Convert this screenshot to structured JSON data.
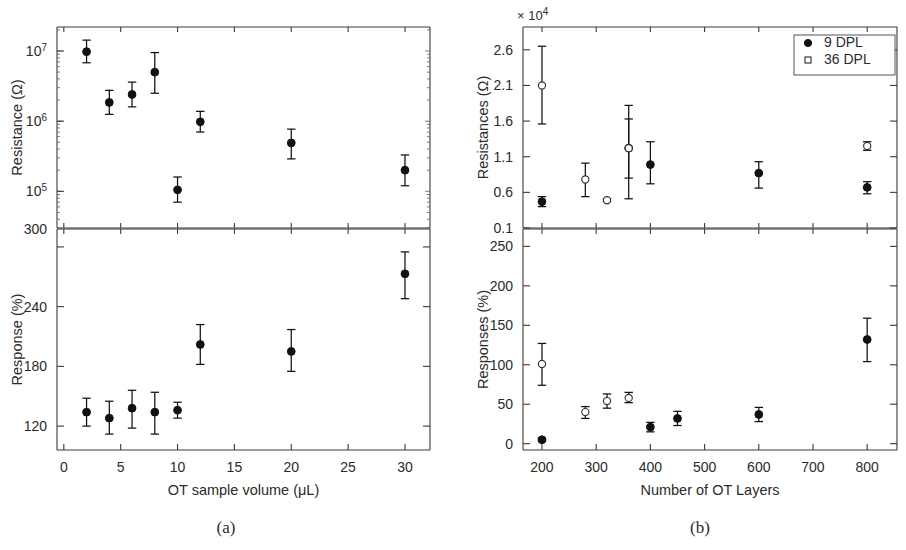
{
  "figure": {
    "panels": [
      {
        "id": "a",
        "caption": "(a)",
        "x_axis": {
          "label": "OT sample volume (μL)",
          "ticks": [
            0,
            5,
            10,
            15,
            20,
            25,
            30
          ],
          "min": -0.6,
          "max": 32.2
        },
        "top": {
          "ylabel": "Resistance (Ω)",
          "scale": "log",
          "ticks": [
            "10",
            "10",
            "10",
            "300"
          ],
          "tick_exponents": [
            "7",
            "6",
            "5",
            ""
          ],
          "tick_values": [
            10000000,
            1000000,
            100000,
            30000
          ]
        },
        "bottom": {
          "ylabel": "Response (%)",
          "scale": "linear",
          "ticks": [
            "300",
            "240",
            "180",
            "120"
          ],
          "tick_values": [
            300,
            240,
            180,
            120
          ]
        }
      },
      {
        "id": "b",
        "caption": "(b)",
        "x_axis": {
          "label": "Number of OT Layers",
          "ticks": [
            200,
            300,
            400,
            500,
            600,
            700,
            800
          ],
          "min": 165,
          "max": 855
        },
        "top": {
          "ylabel": "Resistances (Ω)",
          "exponent_note": "× 10",
          "exponent_power": "4",
          "scale": "linear",
          "ticks": [
            "2.6",
            "2.1",
            "1.6",
            "1.1",
            "0.6",
            "0.1"
          ],
          "tick_values": [
            2.6,
            2.1,
            1.6,
            1.1,
            0.6,
            0.1
          ]
        },
        "bottom": {
          "ylabel": "Responses (%)",
          "scale": "linear",
          "ticks": [
            "250",
            "200",
            "150",
            "100",
            "50",
            "0"
          ],
          "tick_values": [
            250,
            200,
            150,
            100,
            50,
            0
          ]
        },
        "legend": {
          "entries": [
            {
              "label": "9  DPL",
              "marker": "filled-circle"
            },
            {
              "label": "36 DPL",
              "marker": "open-square"
            }
          ]
        }
      }
    ]
  },
  "chart_data": [
    {
      "type": "scatter",
      "panel": "a",
      "subplot": "top",
      "title": "",
      "xlabel": "OT sample volume (μL)",
      "ylabel": "Resistance (Ω)",
      "yscale": "log",
      "xlim": [
        -0.6,
        32.2
      ],
      "ylim": [
        30000,
        22000000
      ],
      "yticks": [
        100000,
        1000000,
        10000000
      ],
      "yticklabels": [
        "10^5",
        "10^6",
        "10^7"
      ],
      "grid": false,
      "legend": "none",
      "series": [
        {
          "name": "Resistance",
          "marker": "filled-circle",
          "x": [
            2,
            4,
            6,
            8,
            10,
            12,
            20,
            30
          ],
          "y": [
            9800000,
            1850000,
            2400000,
            5000000,
            105000,
            980000,
            490000,
            200000
          ],
          "yerr_low": [
            3000000,
            600000,
            800000,
            2500000,
            35000,
            280000,
            200000,
            80000
          ],
          "yerr_high": [
            4500000,
            900000,
            1200000,
            4500000,
            55000,
            400000,
            280000,
            130000
          ]
        }
      ]
    },
    {
      "type": "scatter",
      "panel": "a",
      "subplot": "bottom",
      "title": "",
      "xlabel": "OT sample volume (μL)",
      "ylabel": "Response (%)",
      "yscale": "linear",
      "xlim": [
        -0.6,
        32.2
      ],
      "ylim": [
        96,
        318
      ],
      "yticks": [
        120,
        180,
        240,
        300
      ],
      "grid": false,
      "legend": "none",
      "series": [
        {
          "name": "Response",
          "marker": "filled-circle",
          "x": [
            2,
            4,
            6,
            8,
            10,
            12,
            20,
            30
          ],
          "y": [
            134,
            128,
            138,
            134,
            136,
            202,
            195,
            273
          ],
          "yerr_low": [
            14,
            16,
            20,
            22,
            8,
            20,
            20,
            25
          ],
          "yerr_high": [
            14,
            17,
            18,
            20,
            8,
            20,
            22,
            22
          ]
        }
      ]
    },
    {
      "type": "scatter",
      "panel": "b",
      "subplot": "top",
      "title": "",
      "xlabel": "Number of OT Layers",
      "ylabel": "Resistances (Ω)",
      "y_scale_multiplier": 10000,
      "yscale": "linear",
      "xlim": [
        165,
        855
      ],
      "ylim": [
        0.1,
        2.92
      ],
      "yticks": [
        0.1,
        0.6,
        1.1,
        1.6,
        2.1,
        2.6
      ],
      "grid": false,
      "legend": "upper right",
      "series": [
        {
          "name": "9 DPL",
          "marker": "filled-circle",
          "x": [
            200,
            360,
            400,
            600,
            800
          ],
          "y": [
            0.47,
            1.22,
            0.99,
            0.87,
            0.67
          ],
          "yerr_low": [
            0.07,
            0.42,
            0.27,
            0.21,
            0.09
          ],
          "yerr_high": [
            0.07,
            0.41,
            0.32,
            0.16,
            0.08
          ]
        },
        {
          "name": "36 DPL",
          "marker": "open-circle",
          "x": [
            200,
            280,
            320,
            360,
            800
          ],
          "y": [
            2.1,
            0.78,
            0.49,
            1.22,
            1.25
          ],
          "yerr_low": [
            0.54,
            0.24,
            0.02,
            0.71,
            0.06
          ],
          "yerr_high": [
            0.55,
            0.23,
            0.02,
            0.6,
            0.06
          ]
        }
      ]
    },
    {
      "type": "scatter",
      "panel": "b",
      "subplot": "bottom",
      "title": "",
      "xlabel": "Number of OT Layers",
      "ylabel": "Responses (%)",
      "yscale": "linear",
      "xlim": [
        165,
        855
      ],
      "ylim": [
        -8,
        272
      ],
      "yticks": [
        0,
        50,
        100,
        150,
        200,
        250
      ],
      "grid": false,
      "legend": "none",
      "series": [
        {
          "name": "9 DPL",
          "marker": "filled-circle",
          "x": [
            200,
            400,
            450,
            600,
            800
          ],
          "y": [
            5,
            21,
            32,
            37,
            132
          ],
          "yerr_low": [
            2,
            6,
            9,
            9,
            28
          ],
          "yerr_high": [
            2,
            6,
            9,
            9,
            27
          ]
        },
        {
          "name": "36 DPL",
          "marker": "open-circle",
          "x": [
            200,
            280,
            320,
            360
          ],
          "y": [
            101,
            40,
            54,
            58
          ],
          "yerr_low": [
            27,
            8,
            9,
            6
          ],
          "yerr_high": [
            26,
            7,
            9,
            7
          ]
        }
      ]
    }
  ]
}
